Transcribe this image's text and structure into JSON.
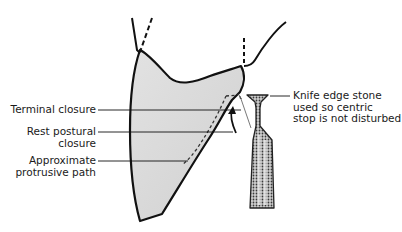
{
  "diagram": {
    "colors": {
      "outline": "#111111",
      "tooth_fill": "#d9d9d9",
      "stone_fill": "#9a9a9a",
      "background": "#ffffff"
    },
    "labels": {
      "terminal_closure": "Terminal closure",
      "rest_postural_line1": "Rest postural",
      "rest_postural_line2": "closure",
      "protrusive_line1": "Approximate",
      "protrusive_line2": "protrusive path",
      "stone_line1": "Knife edge stone",
      "stone_line2": "used so centric",
      "stone_line3": "stop is not disturbed"
    }
  }
}
